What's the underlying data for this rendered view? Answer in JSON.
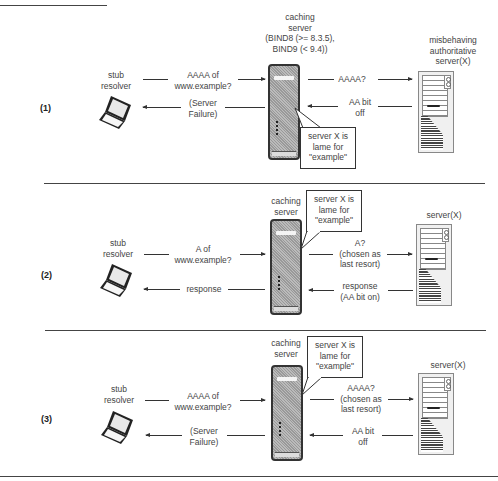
{
  "header": {
    "partial_title_line": true
  },
  "panels": [
    {
      "label": "(1)",
      "stub": {
        "line1": "stub",
        "line2": "resolver"
      },
      "query": {
        "line1": "AAAA of",
        "line2": "www.example?"
      },
      "reply": {
        "line1": "(Server",
        "line2": "Failure)"
      },
      "caching": {
        "line1": "caching",
        "line2": "server",
        "line3": "(BIND8 (>= 8.3.5),",
        "line4": "BIND9 (< 9.4))"
      },
      "callout": {
        "line1": "server X is",
        "line2": "lame for",
        "line3": "\"example\""
      },
      "upstream_query": {
        "line1": "AAAA?"
      },
      "upstream_reply": {
        "line1": "AA bit",
        "line2": "off"
      },
      "auth": {
        "line1": "misbehaving",
        "line2": "authoritative",
        "line3": "server(X)"
      }
    },
    {
      "label": "(2)",
      "stub": {
        "line1": "stub",
        "line2": "resolver"
      },
      "query": {
        "line1": "A of",
        "line2": "www.example?"
      },
      "reply": {
        "line1": "response"
      },
      "caching": {
        "line1": "caching",
        "line2": "server"
      },
      "callout": {
        "line1": "server X is",
        "line2": "lame for",
        "line3": "\"example\""
      },
      "upstream_query": {
        "line1": "A?",
        "line2": "(chosen as",
        "line3": "last resort)"
      },
      "upstream_reply": {
        "line1": "response",
        "line2": "(AA bit on)"
      },
      "auth": {
        "line1": "server(X)"
      }
    },
    {
      "label": "(3)",
      "stub": {
        "line1": "stub",
        "line2": "resolver"
      },
      "query": {
        "line1": "AAAA of",
        "line2": "www.example?"
      },
      "reply": {
        "line1": "(Server",
        "line2": "Failure)"
      },
      "caching": {
        "line1": "caching",
        "line2": "server"
      },
      "callout": {
        "line1": "server X is",
        "line2": "lame for",
        "line3": "\"example\""
      },
      "upstream_query": {
        "line1": "AAAA?",
        "line2": "(chosen as",
        "line3": "last resort)"
      },
      "upstream_reply": {
        "line1": "AA bit",
        "line2": "off"
      },
      "auth": {
        "line1": "server(X)"
      }
    }
  ]
}
